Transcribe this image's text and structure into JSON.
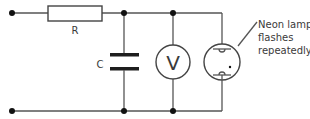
{
  "diagram": {
    "type": "circuit",
    "components": {
      "resistor": {
        "label": "R"
      },
      "capacitor": {
        "label": "C"
      },
      "voltmeter": {
        "symbol": "V"
      },
      "neon_lamp": {
        "annotation": [
          "Neon lamp",
          "flashes",
          "repeatedly"
        ]
      }
    },
    "colors": {
      "wire": "#555555",
      "text": "#3a3a3a",
      "background": "#ffffff"
    }
  }
}
